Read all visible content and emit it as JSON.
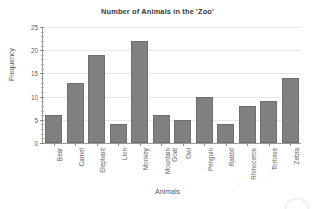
{
  "chart_data": {
    "type": "bar",
    "title": "Number of Animals in the 'Zoo'",
    "xlabel": "Animals",
    "ylabel": "Frequency",
    "categories": [
      "Bear",
      "Camel",
      "Elephant",
      "Lion",
      "Monkey",
      "Mountain Goat",
      "Owl",
      "Penguin",
      "Rabbit",
      "Rhinoceros",
      "Tortoise",
      "Zebra"
    ],
    "values": [
      6,
      13,
      19,
      4,
      22,
      6,
      5,
      10,
      4,
      8,
      9,
      14
    ],
    "ylim": [
      0,
      25
    ],
    "ytick_labels": [
      "0",
      "5",
      "10",
      "15",
      "20",
      "25"
    ],
    "ytick_values": [
      0,
      5,
      10,
      15,
      20,
      25
    ],
    "yminor_step": 1,
    "grid": "horizontal-major",
    "legend": "none",
    "bar_color": "#808080",
    "bar_edge_color": "#6e6e6e",
    "gridline_color": "#e8e8e8",
    "axis_color": "#9a9a9a",
    "background_color": "#ffffff",
    "xtick_label_rotation": -90,
    "annotations": {
      "stray_mark": "r"
    }
  }
}
